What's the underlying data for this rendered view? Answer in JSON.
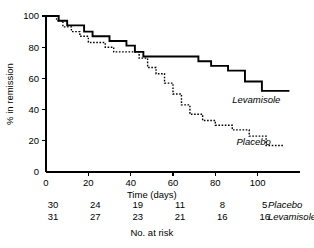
{
  "chart_data": {
    "type": "line",
    "title": "",
    "xlabel": "Time (days)",
    "ylabel": "% in remission",
    "xlim": [
      0,
      120
    ],
    "ylim": [
      0,
      100
    ],
    "xticks": [
      0,
      20,
      40,
      60,
      80,
      100
    ],
    "xticklabels": [
      "0",
      "20",
      "40",
      "60",
      "80",
      "100"
    ],
    "yticks": [
      0,
      20,
      40,
      60,
      80,
      100
    ],
    "yticklabels": [
      "0",
      "20",
      "40",
      "60",
      "80",
      "100"
    ],
    "grid": false,
    "legend_position": "inline-right",
    "step_style": "post",
    "series": [
      {
        "name": "Levamisole",
        "style": "solid",
        "label": "Levamisole",
        "label_x": 88,
        "label_y": 44,
        "x": [
          0,
          3,
          6,
          10,
          14,
          18,
          22,
          26,
          30,
          34,
          38,
          42,
          46,
          50,
          58,
          66,
          72,
          78,
          86,
          94,
          102,
          115
        ],
        "y": [
          100,
          100,
          97,
          94,
          94,
          90,
          87,
          87,
          84,
          84,
          81,
          77,
          74,
          74,
          74,
          74,
          71,
          68,
          65,
          58,
          52,
          52
        ]
      },
      {
        "name": "Placebo",
        "style": "dotted",
        "label": "Placebo",
        "label_x": 90,
        "label_y": 17,
        "x": [
          0,
          2,
          5,
          8,
          12,
          16,
          20,
          24,
          28,
          32,
          36,
          40,
          44,
          48,
          52,
          56,
          60,
          64,
          68,
          74,
          80,
          88,
          96,
          104,
          112
        ],
        "y": [
          100,
          100,
          97,
          93,
          90,
          87,
          83,
          83,
          80,
          77,
          77,
          77,
          73,
          67,
          63,
          57,
          50,
          43,
          37,
          33,
          30,
          27,
          23,
          17,
          17
        ]
      }
    ]
  },
  "risk_table": {
    "caption": "No. at risk",
    "times": [
      0,
      20,
      40,
      60,
      80,
      100
    ],
    "rows": [
      {
        "group": "Placebo",
        "counts": [
          "30",
          "24",
          "19",
          "11",
          "8",
          "5"
        ]
      },
      {
        "group": "Levamisole",
        "counts": [
          "31",
          "27",
          "23",
          "21",
          "16",
          "16"
        ]
      }
    ]
  }
}
